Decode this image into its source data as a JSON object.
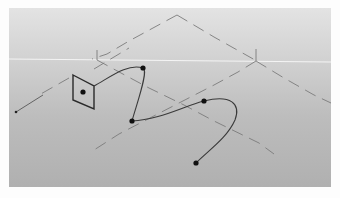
{
  "viewport": {
    "label": "3D viewport",
    "background_top": "#e3e3e3",
    "background_bottom": "#b0b0b0",
    "horizon_color": "#f4f4f4",
    "guide_color": "#7a7a7a",
    "curve_color": "#3a3a3a",
    "point_color": "#111111"
  },
  "scene": {
    "horizon": {
      "x1": 0,
      "y1": 51,
      "x2": 322,
      "y2": 54
    },
    "image_plane": {
      "corners": [
        [
          64,
          67
        ],
        [
          85,
          78
        ],
        [
          85,
          101
        ],
        [
          64,
          92
        ]
      ],
      "center": [
        74,
        84
      ]
    },
    "bezier_curve": {
      "control_points": [
        [
          134,
          60
        ],
        [
          123,
          113
        ],
        [
          195,
          93
        ],
        [
          187,
          155
        ]
      ]
    },
    "camera_ray": {
      "from": [
        7,
        104
      ],
      "to": [
        34,
        87
      ]
    }
  }
}
